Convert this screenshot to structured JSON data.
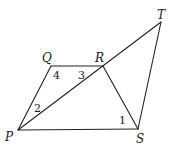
{
  "diagram": {
    "type": "geometry",
    "points": {
      "P": {
        "label": "P",
        "x": 18,
        "y": 130
      },
      "Q": {
        "label": "Q",
        "x": 51,
        "y": 66
      },
      "R": {
        "label": "R",
        "x": 103,
        "y": 66
      },
      "S": {
        "label": "S",
        "x": 138,
        "y": 129
      },
      "T": {
        "label": "T",
        "x": 161,
        "y": 22
      }
    },
    "segments": [
      {
        "name": "PQ",
        "from": "P",
        "to": "Q"
      },
      {
        "name": "QR",
        "from": "Q",
        "to": "R"
      },
      {
        "name": "RS",
        "from": "R",
        "to": "S"
      },
      {
        "name": "PS",
        "from": "P",
        "to": "S"
      },
      {
        "name": "PT",
        "from": "P",
        "to": "T"
      },
      {
        "name": "ST",
        "from": "S",
        "to": "T"
      }
    ],
    "angles": [
      {
        "label": "1",
        "vertex": "S"
      },
      {
        "label": "2",
        "vertex": "P"
      },
      {
        "label": "3",
        "vertex": "R"
      },
      {
        "label": "4",
        "vertex": "Q"
      }
    ],
    "stroke_color": "#222222"
  }
}
